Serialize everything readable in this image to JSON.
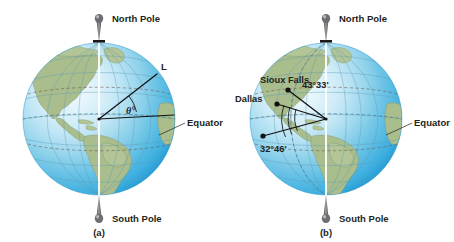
{
  "figure": {
    "type": "diagram",
    "width": 454,
    "height": 242,
    "background_color": "#ffffff"
  },
  "colors": {
    "ocean_light": "#cfeaf6",
    "ocean_mid": "#7ecbe8",
    "ocean_deep": "#2fa8dd",
    "land": "#a9bd8d",
    "land_light": "#b3c596",
    "grid_line": "#5b9bb5",
    "dashed_latitude": "#6a5b52",
    "axis_white": "#ffffff",
    "ink": "#231f20",
    "pin_gray": "#6e6e72"
  },
  "panels": [
    {
      "id": "a",
      "caption": "(a)",
      "labels": {
        "north_pole": "North Pole",
        "south_pole": "South Pole",
        "equator": "Equator",
        "radius": "L",
        "angle": "θ°"
      },
      "annotations": [
        {
          "name": "radius-line-L",
          "from": "earth-center",
          "to": "surface-northeast",
          "label": "L"
        },
        {
          "name": "equator-radius-line",
          "from": "earth-center",
          "to": "surface-east-equator",
          "label": ""
        },
        {
          "name": "angle-theta",
          "label": "θ°",
          "vertex": "earth-center"
        }
      ]
    },
    {
      "id": "b",
      "caption": "(b)",
      "labels": {
        "north_pole": "North Pole",
        "south_pole": "South Pole",
        "equator": "Equator",
        "sioux_falls": "Sioux Falls",
        "dallas": "Dallas",
        "sioux_falls_latitude": "43°33'",
        "dallas_latitude": "32°46'"
      },
      "cities": [
        {
          "name": "Sioux Falls",
          "latitude_label": "43°33'"
        },
        {
          "name": "Dallas",
          "latitude_label": "32°46'"
        }
      ],
      "annotations": [
        {
          "name": "radius-to-sioux-falls",
          "label": "43°33'"
        },
        {
          "name": "radius-to-dallas",
          "label": "32°46'"
        },
        {
          "name": "equator-radius-line",
          "label": ""
        }
      ]
    }
  ]
}
